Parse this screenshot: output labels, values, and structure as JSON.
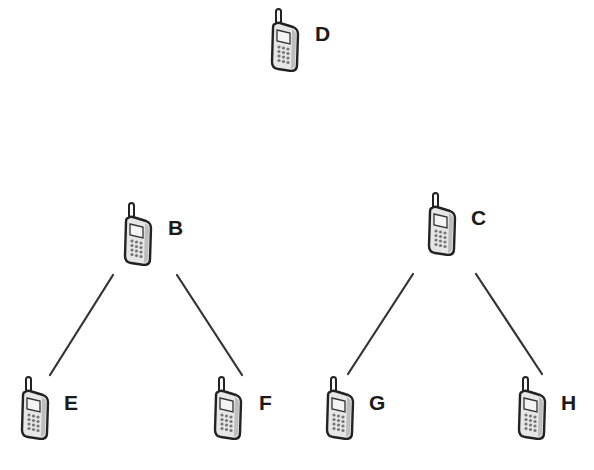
{
  "diagram": {
    "type": "tree",
    "nodes": [
      {
        "id": "D",
        "label": "D",
        "icon": "mobile-phone-icon",
        "x": 270,
        "y": 8,
        "lx": 315,
        "ly": 33
      },
      {
        "id": "B",
        "label": "B",
        "icon": "mobile-phone-icon",
        "x": 123,
        "y": 202,
        "lx": 168,
        "ly": 227
      },
      {
        "id": "C",
        "label": "C",
        "icon": "mobile-phone-icon",
        "x": 427,
        "y": 192,
        "lx": 471,
        "ly": 217
      },
      {
        "id": "E",
        "label": "E",
        "icon": "mobile-phone-icon",
        "x": 20,
        "y": 376,
        "lx": 64,
        "ly": 402
      },
      {
        "id": "F",
        "label": "F",
        "icon": "mobile-phone-icon",
        "x": 213,
        "y": 376,
        "lx": 259,
        "ly": 402
      },
      {
        "id": "G",
        "label": "G",
        "icon": "mobile-phone-icon",
        "x": 325,
        "y": 376,
        "lx": 369,
        "ly": 402
      },
      {
        "id": "H",
        "label": "H",
        "icon": "mobile-phone-icon",
        "x": 517,
        "y": 376,
        "lx": 561,
        "ly": 402
      }
    ],
    "edges": [
      {
        "from": "B",
        "to": "E",
        "x1": 113,
        "y1": 275,
        "x2": 50,
        "y2": 375
      },
      {
        "from": "B",
        "to": "F",
        "x1": 177,
        "y1": 275,
        "x2": 242,
        "y2": 375
      },
      {
        "from": "C",
        "to": "G",
        "x1": 413,
        "y1": 274,
        "x2": 348,
        "y2": 374
      },
      {
        "from": "C",
        "to": "H",
        "x1": 476,
        "y1": 274,
        "x2": 542,
        "y2": 374
      }
    ],
    "colors": {
      "line": "#333333",
      "label": "#1a1a1a",
      "phone_outline": "#222222",
      "phone_body": "#e8e8e8"
    }
  }
}
